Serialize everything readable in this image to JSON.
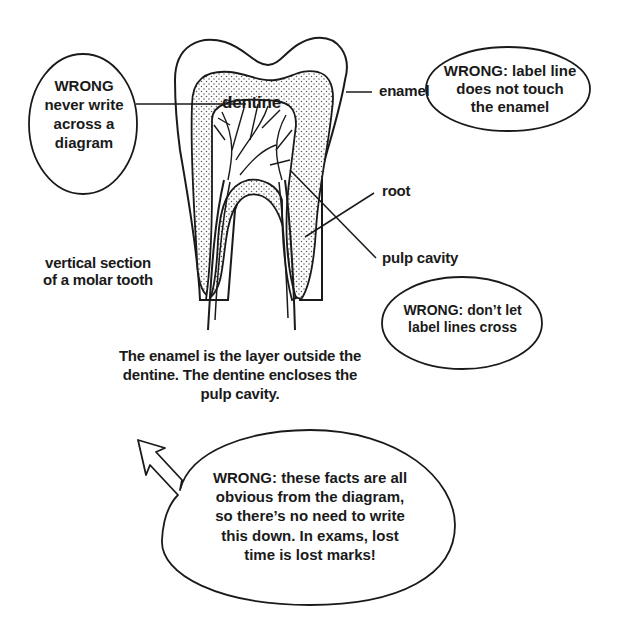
{
  "diagram": {
    "subject": "vertical section of a molar tooth",
    "labels": {
      "dentine": "dentine",
      "enamel": "enamel",
      "root": "root",
      "pulp_cavity": "pulp cavity",
      "caption_line1": "vertical section",
      "caption_line2": "of a molar tooth"
    },
    "description": {
      "line1": "The enamel is the layer outside the",
      "line2": "dentine. The dentine encloses the",
      "line3": "pulp cavity."
    },
    "callouts": [
      {
        "id": "write-across",
        "lines": [
          "WRONG",
          "never write",
          "across a",
          "diagram"
        ]
      },
      {
        "id": "label-touch",
        "lines": [
          "WRONG: label line",
          "does not touch",
          "the enamel"
        ]
      },
      {
        "id": "lines-cross",
        "lines": [
          "WRONG: don’t let",
          "label lines cross"
        ]
      },
      {
        "id": "obvious-facts",
        "lines": [
          "WRONG: these facts are all",
          "obvious from the diagram,",
          "so there’s no need to write",
          "this down. In exams, lost",
          "time is lost marks!"
        ]
      }
    ],
    "colors": {
      "ink": "#1a1a1a",
      "background": "#ffffff",
      "stipple": "#555555"
    }
  }
}
